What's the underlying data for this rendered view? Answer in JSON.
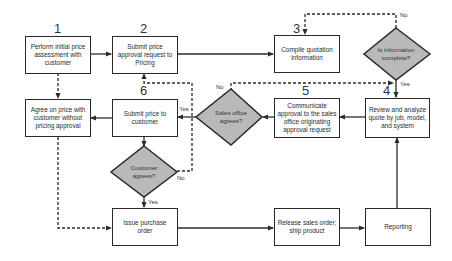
{
  "diagram": {
    "type": "flowchart",
    "title": "",
    "colors": {
      "line": "#2a2a2a",
      "decision_fill": "#b9b9b9",
      "box_fill": "#ffffff"
    },
    "steps": [
      {
        "id": "s1",
        "number": "1",
        "label": "Perform initial price assessment with customer"
      },
      {
        "id": "s2",
        "number": "2",
        "label": "Submit price approval request to Pricing"
      },
      {
        "id": "s3",
        "number": "3",
        "label": "Compile quotation information"
      },
      {
        "id": "s4",
        "number": "4",
        "label": "Review and analyze quote by job, model, and system"
      },
      {
        "id": "s5",
        "number": "5",
        "label": "Communicate approval to the sales office originating approval request"
      },
      {
        "id": "s6",
        "number": "6",
        "label": "Submit price to customer"
      },
      {
        "id": "agree",
        "number": "",
        "label": "Agree on price with customer without pricing approval"
      },
      {
        "id": "po",
        "number": "",
        "label": "Issue purchase order"
      },
      {
        "id": "release",
        "number": "",
        "label": "Release sales order; ship product"
      },
      {
        "id": "report",
        "number": "",
        "label": "Reporting"
      }
    ],
    "decisions": [
      {
        "id": "d_info",
        "label": "Is information complete?",
        "yes": "Yes",
        "no": "No"
      },
      {
        "id": "d_sales",
        "label": "Sales office agrees?",
        "yes": "Yes",
        "no": "No"
      },
      {
        "id": "d_cust",
        "label": "Customer agrees?",
        "yes": "Yes",
        "no": "No"
      }
    ],
    "edges": [
      {
        "from": "s1",
        "to": "s2",
        "style": "solid"
      },
      {
        "from": "s1",
        "to": "agree",
        "style": "dashed"
      },
      {
        "from": "s2",
        "to": "s3",
        "style": "solid"
      },
      {
        "from": "s3",
        "to": "d_info",
        "style": "solid"
      },
      {
        "from": "d_info",
        "to": "s3",
        "label": "No",
        "style": "dashed"
      },
      {
        "from": "d_info",
        "to": "s4",
        "label": "Yes",
        "style": "solid"
      },
      {
        "from": "s4",
        "to": "s5",
        "style": "solid"
      },
      {
        "from": "s5",
        "to": "d_sales",
        "style": "solid"
      },
      {
        "from": "d_sales",
        "to": "s6",
        "label": "Yes",
        "style": "solid"
      },
      {
        "from": "d_sales",
        "to": "s4",
        "label": "No",
        "style": "dashed"
      },
      {
        "from": "s6",
        "to": "agree",
        "style": "solid"
      },
      {
        "from": "s6",
        "to": "d_cust",
        "style": "solid"
      },
      {
        "from": "d_cust",
        "to": "po",
        "label": "Yes",
        "style": "solid"
      },
      {
        "from": "d_cust",
        "to": "s2",
        "label": "No",
        "style": "dashed"
      },
      {
        "from": "agree",
        "to": "po",
        "style": "dashed"
      },
      {
        "from": "po",
        "to": "release",
        "style": "solid"
      },
      {
        "from": "release",
        "to": "report",
        "style": "solid"
      },
      {
        "from": "report",
        "to": "s4",
        "style": "solid"
      }
    ]
  }
}
